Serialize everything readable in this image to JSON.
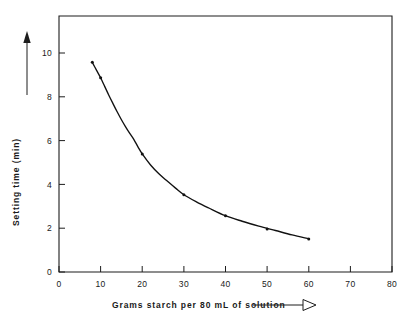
{
  "chart_data": {
    "type": "line",
    "title": "",
    "xlabel": "Grams  starch per 80 mL of solution",
    "ylabel": "Setting time  (min)",
    "xlim": [
      0,
      80
    ],
    "ylim": [
      0,
      11.6
    ],
    "xticks": [
      0,
      10,
      20,
      30,
      40,
      50,
      60,
      70,
      80
    ],
    "xtick_labels": [
      "0",
      "10",
      "20",
      "30",
      "40",
      "50",
      "60",
      "70",
      "80"
    ],
    "yticks": [
      0,
      2,
      4,
      6,
      8,
      10
    ],
    "ytick_labels": [
      "0",
      "2",
      "4",
      "6",
      "8",
      "10"
    ],
    "grid": false,
    "legend": null,
    "series": [
      {
        "name": "setting time vs starch concentration",
        "x": [
          8,
          10,
          20,
          30,
          40,
          50,
          60
        ],
        "values": [
          9.5,
          8.8,
          5.35,
          3.5,
          2.55,
          1.95,
          1.5
        ]
      }
    ],
    "curve_points": {
      "x": [
        8,
        9,
        10,
        11,
        12,
        13,
        14,
        15,
        16,
        17,
        18,
        19,
        20,
        22,
        24,
        26,
        28,
        30,
        33,
        36,
        40,
        44,
        48,
        52,
        56,
        60
      ],
      "y": [
        9.5,
        9.15,
        8.8,
        8.4,
        8.0,
        7.62,
        7.25,
        6.9,
        6.58,
        6.28,
        6.0,
        5.66,
        5.35,
        4.85,
        4.45,
        4.12,
        3.8,
        3.5,
        3.18,
        2.9,
        2.55,
        2.3,
        2.08,
        1.88,
        1.68,
        1.5
      ]
    },
    "axis_colors": {
      "frame": "#1d1d1d",
      "curve": "#111111",
      "background": "#ffffff"
    },
    "decorations": {
      "y_axis_arrow": "up-arrow-solid",
      "x_label_arrow": "right-arrow-hollow"
    }
  }
}
